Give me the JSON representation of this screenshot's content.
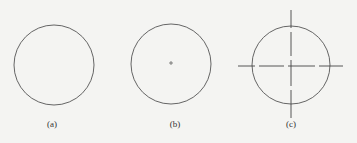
{
  "figure": {
    "panels": [
      {
        "label": "(a)",
        "description": "plain circle"
      },
      {
        "label": "(b)",
        "description": "circle with center point mark"
      },
      {
        "label": "(c)",
        "description": "circle with dash-dot centerlines"
      }
    ],
    "colors": {
      "stroke": "#555555",
      "background": "#f4f4f2"
    }
  }
}
